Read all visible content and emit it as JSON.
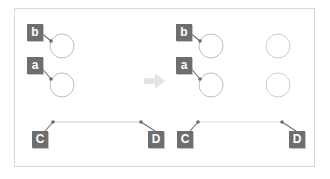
{
  "diagram": {
    "background_color": "#ffffff",
    "frame_border_color": "#d8d8d8",
    "label_box_color": "#6e6e6e",
    "label_text_color": "#ffffff",
    "circle_stroke_color": "#bdbdbd",
    "leader_line_color": "#6e6e6e",
    "connector_line_color": "#c9c9c9",
    "arrow_color": "#e2e2e2",
    "arrow_icon_name": "right-arrow-icon",
    "panels": [
      {
        "id": "before",
        "name": "before-panel",
        "circles": [
          {
            "name": "circle-b",
            "label": "b",
            "cx": 62,
            "cy": 46,
            "r": 12
          },
          {
            "name": "circle-a",
            "label": "a",
            "cx": 62,
            "cy": 85,
            "r": 12
          }
        ],
        "labels": [
          {
            "name": "label-b",
            "text": "b",
            "x": 27,
            "y": 24
          },
          {
            "name": "label-a",
            "text": "a",
            "x": 27,
            "y": 57
          },
          {
            "name": "label-c",
            "text": "C",
            "x": 32,
            "y": 131
          },
          {
            "name": "label-d",
            "text": "D",
            "x": 148,
            "y": 131
          }
        ],
        "anchors": [
          {
            "name": "anchor-b",
            "x": 51,
            "y": 41
          },
          {
            "name": "anchor-a",
            "x": 51,
            "y": 79
          },
          {
            "name": "anchor-c",
            "x": 53,
            "y": 122
          },
          {
            "name": "anchor-d",
            "x": 141,
            "y": 122
          }
        ],
        "connector": {
          "name": "connector-line-cd",
          "x1": 53,
          "y1": 122,
          "x2": 141,
          "y2": 122,
          "color": "#c9c9c9"
        }
      },
      {
        "id": "after",
        "name": "after-panel",
        "circles": [
          {
            "name": "circle-b",
            "label": "b",
            "cx": 211,
            "cy": 46,
            "r": 12
          },
          {
            "name": "circle-a",
            "label": "a",
            "cx": 211,
            "cy": 85,
            "r": 12
          },
          {
            "name": "circle-unlabeled-top",
            "label": "",
            "cx": 278,
            "cy": 46,
            "r": 12
          },
          {
            "name": "circle-unlabeled-bottom",
            "label": "",
            "cx": 278,
            "cy": 85,
            "r": 12
          }
        ],
        "labels": [
          {
            "name": "label-b",
            "text": "b",
            "x": 176,
            "y": 24
          },
          {
            "name": "label-a",
            "text": "a",
            "x": 176,
            "y": 57
          },
          {
            "name": "label-c",
            "text": "C",
            "x": 177,
            "y": 131
          },
          {
            "name": "label-d",
            "text": "D",
            "x": 289,
            "y": 131
          }
        ],
        "anchors": [
          {
            "name": "anchor-b",
            "x": 200,
            "y": 41
          },
          {
            "name": "anchor-a",
            "x": 200,
            "y": 79
          },
          {
            "name": "anchor-c",
            "x": 198,
            "y": 122
          },
          {
            "name": "anchor-d",
            "x": 282,
            "y": 122
          }
        ],
        "connector": {
          "name": "connector-line-cd",
          "x1": 198,
          "y1": 122,
          "x2": 282,
          "y2": 122,
          "color": "#dedede"
        }
      }
    ],
    "transition_arrow": {
      "name": "transition-arrow",
      "x": 144,
      "y": 72,
      "width": 22,
      "height": 18,
      "direction": "right",
      "color": "#e2e2e2"
    }
  }
}
